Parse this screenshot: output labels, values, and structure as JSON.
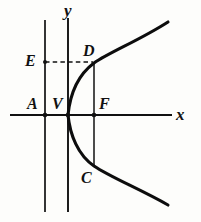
{
  "figure": {
    "width": 201,
    "height": 222,
    "background_color": "#fdfdfb",
    "ink_color": "#111111",
    "curve_color": "#0d0d0d"
  },
  "axes": {
    "x_label": "x",
    "y_label": "y",
    "x_axis": {
      "y": 115,
      "x_start": 10,
      "x_end": 172
    },
    "y_axis": {
      "x": 68,
      "y_start": 18,
      "y_end": 212
    }
  },
  "lines": {
    "directrix": {
      "name": "directrix",
      "x": 45,
      "y_start": 20,
      "y_end": 212
    },
    "latus_rectum": {
      "name": "latus-rectum-chord",
      "x": 94,
      "y_start": 63,
      "y_end": 166
    },
    "dashed_segment": {
      "name": "e-to-d-dashed",
      "x_start": 45,
      "x_end": 94,
      "y": 62
    }
  },
  "points": [
    {
      "id": "A",
      "label": "A",
      "x": 45,
      "y": 115,
      "label_x": 27,
      "label_y": 96,
      "dot": true
    },
    {
      "id": "V",
      "label": "V",
      "x": 68,
      "y": 115,
      "label_x": 52,
      "label_y": 96,
      "dot": true
    },
    {
      "id": "F",
      "label": "F",
      "x": 94,
      "y": 115,
      "label_x": 99,
      "label_y": 96,
      "dot": true
    },
    {
      "id": "D",
      "label": "D",
      "x": 94,
      "y": 63,
      "label_x": 83,
      "label_y": 43,
      "dot": false
    },
    {
      "id": "C",
      "label": "C",
      "x": 94,
      "y": 166,
      "label_x": 81,
      "label_y": 170,
      "dot": false
    },
    {
      "id": "E",
      "label": "E",
      "x": 45,
      "y": 62,
      "label_x": 25,
      "label_y": 53,
      "dot": false
    }
  ],
  "curve": {
    "type": "parabola",
    "orientation": "opens-right",
    "vertex": {
      "x": 68,
      "y": 115
    },
    "path": "M 168 22 C 140 40 110 52 94 63 C 78 75 70 95 68 115 C 70 135 78 155 94 166 C 110 177 140 189 168 205"
  },
  "labels": {
    "x_axis_label_x": 176,
    "x_axis_label_y": 106,
    "y_axis_label_x": 64,
    "y_axis_label_y": 2
  }
}
